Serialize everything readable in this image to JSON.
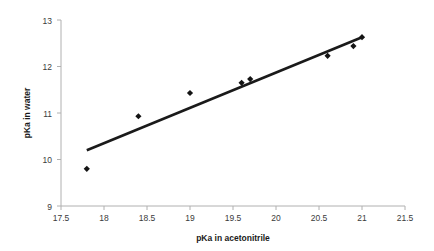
{
  "chart_data": {
    "type": "scatter",
    "title": "",
    "xlabel": "pKa in acetonitrile",
    "ylabel": "pKa in water",
    "xlim": [
      17.5,
      21.5
    ],
    "ylim": [
      9,
      13
    ],
    "xticks": [
      17.5,
      18,
      18.5,
      19,
      19.5,
      20,
      20.5,
      21,
      21.5
    ],
    "xtick_labels": [
      "17.5",
      "18",
      "18.5",
      "19",
      "19.5",
      "20",
      "20.5",
      "21",
      "21.5"
    ],
    "yticks": [
      9,
      10,
      11,
      12,
      13
    ],
    "ytick_labels": [
      "9",
      "10",
      "11",
      "12",
      "13"
    ],
    "grid": false,
    "legend": false,
    "legend_position": "none",
    "marker_style": "filled-diamond",
    "marker_color": "#141414",
    "series": [
      {
        "name": "pKa data",
        "x": [
          17.8,
          18.4,
          19.0,
          19.6,
          19.7,
          20.6,
          20.9,
          21.0
        ],
        "y": [
          9.8,
          10.93,
          11.43,
          11.65,
          11.73,
          12.23,
          12.44,
          12.63
        ]
      }
    ],
    "trendline": {
      "name": "linear fit",
      "color": "#1a1a1a",
      "x_start": 17.8,
      "y_start": 10.2,
      "x_end": 21.0,
      "y_end": 12.63,
      "slope": 0.759,
      "intercept": -3.31
    },
    "annotations": []
  }
}
